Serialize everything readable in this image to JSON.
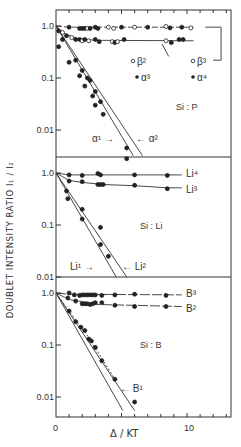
{
  "figure": {
    "ylabel": "DOUBLET INTENSITY RATIO I₁ / I₂",
    "xlabel": "Δ / KT",
    "xticks": [
      "0",
      "10"
    ]
  },
  "chart_data": [
    {
      "type": "scatter",
      "panel": "Si:P",
      "title": "Si : P",
      "xlabel": "Δ/KT",
      "ylabel": "Doublet intensity ratio I1/I2",
      "yscale": "log",
      "ylim": [
        0.004,
        1.4
      ],
      "xlim": [
        0,
        13.4
      ],
      "yticks": [
        "1.0",
        "0.1",
        "0.01"
      ],
      "grid": false,
      "legend": [
        {
          "marker": "open",
          "label": "β²"
        },
        {
          "marker": "filled",
          "label": "α³"
        },
        {
          "marker": "open",
          "label": "β³"
        },
        {
          "marker": "filled",
          "label": "α⁴"
        }
      ],
      "series": [
        {
          "name": "α⁴ / β³",
          "level": 1.0,
          "x": [
            1.0,
            1.8,
            2.0,
            2.2,
            2.4,
            2.6,
            3.0,
            3.2,
            4.0,
            4.4,
            5.0,
            6.0,
            7.0,
            8.4,
            8.7,
            9.6,
            10.3
          ],
          "y": [
            0.95,
            0.9,
            0.9,
            0.9,
            0.9,
            0.9,
            0.95,
            0.9,
            0.95,
            0.9,
            0.95,
            0.95,
            0.95,
            0.98,
            0.92,
            0.95,
            0.92
          ]
        },
        {
          "name": "α³ / β²",
          "level": 0.5,
          "x": [
            0.2,
            0.5,
            0.8,
            1.2,
            1.5,
            1.8,
            2.0,
            2.2,
            2.5,
            3.0,
            3.3,
            4.3,
            4.5,
            4.7,
            5.2,
            8.4,
            8.8,
            9.4,
            9.7
          ],
          "y": [
            0.8,
            0.75,
            0.65,
            0.6,
            0.55,
            0.55,
            0.52,
            0.55,
            0.52,
            0.55,
            0.5,
            0.5,
            0.48,
            0.5,
            0.55,
            0.52,
            0.48,
            0.55,
            0.55
          ]
        },
        {
          "name": "α²",
          "fit": "line from (0,1.0) to (6.6,0.0045)",
          "x": [
            0.5,
            1.5,
            2.0,
            2.4,
            2.6,
            3.0,
            3.4,
            5.4
          ],
          "y": [
            0.55,
            0.22,
            0.14,
            0.1,
            0.09,
            0.055,
            0.035,
            0.0045
          ]
        },
        {
          "name": "α¹",
          "fit": "line from (0,1.0) to (5.8,0.0045)",
          "x": [
            0.2,
            1.0,
            1.8,
            2.2,
            2.8,
            3.0,
            3.6,
            5.4
          ],
          "y": [
            0.4,
            0.2,
            0.11,
            0.07,
            0.045,
            0.03,
            0.02,
            0.0028
          ]
        }
      ],
      "annotations": [
        "α¹ →",
        "← α²",
        "Si : P"
      ]
    },
    {
      "type": "scatter",
      "panel": "Si:Li",
      "title": "Si : Li",
      "xlabel": "Δ/KT",
      "yscale": "log",
      "ylim": [
        0.01,
        1.4
      ],
      "xlim": [
        0,
        13.4
      ],
      "yticks": [
        "1.0",
        "0.1",
        "0.01"
      ],
      "series": [
        {
          "name": "Li⁴",
          "level": 0.92,
          "x": [
            1.0,
            2.0,
            3.2,
            3.4,
            6.0,
            8.5
          ],
          "y": [
            0.92,
            0.9,
            0.98,
            0.92,
            0.92,
            0.9
          ]
        },
        {
          "name": "Li³",
          "level": 0.55,
          "x": [
            1.0,
            2.0,
            3.2,
            3.4,
            3.6,
            6.0,
            8.5
          ],
          "y": [
            0.7,
            0.68,
            0.6,
            0.6,
            0.6,
            0.58,
            0.5
          ]
        },
        {
          "name": "Li²",
          "fit": "line from (0,1.0) to (5.4,0.01)",
          "x": [
            0.8,
            2.0,
            3.4,
            4.0
          ],
          "y": [
            0.45,
            0.2,
            0.09,
            0.025
          ]
        },
        {
          "name": "Li¹",
          "fit": "line from (0,1.0) to (4.6,0.01)",
          "x": [
            0.9,
            2.0,
            3.4
          ],
          "y": [
            0.32,
            0.13,
            0.042
          ]
        }
      ],
      "annotations": [
        "Li¹ →",
        "← Li²",
        "Si : Li"
      ]
    },
    {
      "type": "scatter",
      "panel": "Si:B",
      "title": "Si : B",
      "xlabel": "Δ/KT",
      "yscale": "log",
      "ylim": [
        0.005,
        1.4
      ],
      "xlim": [
        0,
        13.4
      ],
      "xticks": [
        0,
        10
      ],
      "yticks": [
        "1.0",
        "0.1",
        "0.01"
      ],
      "series": [
        {
          "name": "B³",
          "level": 0.92,
          "x": [
            1.0,
            1.4,
            1.8,
            2.0,
            2.2,
            2.4,
            2.6,
            2.8,
            3.0,
            3.5,
            4.5,
            6.0,
            8.4
          ],
          "y": [
            1.0,
            0.92,
            0.9,
            0.92,
            0.92,
            0.92,
            0.92,
            0.92,
            0.92,
            0.9,
            0.92,
            0.95,
            0.9
          ]
        },
        {
          "name": "B²",
          "level": 0.55,
          "x": [
            0.9,
            1.5,
            2.0,
            2.2,
            2.4,
            2.6,
            2.8,
            3.0,
            3.5,
            4.5,
            6.0,
            8.4
          ],
          "y": [
            0.8,
            0.7,
            0.62,
            0.62,
            0.62,
            0.6,
            0.62,
            0.65,
            0.65,
            0.58,
            0.55,
            0.55
          ]
        },
        {
          "name": "B¹",
          "fit": "line from (0,1.0) to (5.8,0.006) dashed through points",
          "x": [
            1.0,
            1.5,
            1.9,
            2.2,
            2.5,
            2.7,
            3.0,
            3.5,
            4.5,
            6.0
          ],
          "y": [
            0.45,
            0.28,
            0.22,
            0.19,
            0.13,
            0.12,
            0.09,
            0.05,
            0.022,
            0.008
          ]
        }
      ],
      "annotations": [
        "← B¹",
        "Si : B"
      ]
    }
  ]
}
